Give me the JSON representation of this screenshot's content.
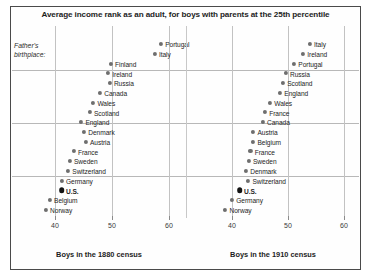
{
  "figure": {
    "title": "Average income rank as an adult, for boys with parents at the 25th percentile",
    "annotation": "Father's\nbirthplace:"
  },
  "panels": [
    {
      "id": "left",
      "caption": "Boys in the 1880 census",
      "axis_ticks": [
        "40",
        "50",
        "60"
      ]
    },
    {
      "id": "right",
      "caption": "Boys in the 1910 census",
      "axis_ticks": [
        "40",
        "50",
        "60"
      ]
    }
  ],
  "chart_data": {
    "type": "scatter",
    "title": "Average income rank as an adult, for boys with parents at the 25th percentile",
    "xlabel": "",
    "ylabel": "",
    "xlim": [
      36,
      62
    ],
    "grid": true,
    "legend": "none",
    "annotations": [
      "Father's birthplace:"
    ],
    "panels": [
      {
        "name": "Boys in the 1880 census",
        "caption": "Boys in the 1880 census",
        "xticks": [
          40,
          50,
          60
        ],
        "points": [
          {
            "label": "Portugal",
            "value": 58.6,
            "highlight": false
          },
          {
            "label": "Italy",
            "value": 57.5,
            "highlight": false
          },
          {
            "label": "Finland",
            "value": 49.8,
            "highlight": false
          },
          {
            "label": "Ireland",
            "value": 49.3,
            "highlight": false
          },
          {
            "label": "Russia",
            "value": 49.6,
            "highlight": false
          },
          {
            "label": "Canada",
            "value": 47.9,
            "highlight": false
          },
          {
            "label": "Wales",
            "value": 46.7,
            "highlight": false
          },
          {
            "label": "Scotland",
            "value": 46.1,
            "highlight": false
          },
          {
            "label": "England",
            "value": 44.6,
            "highlight": false
          },
          {
            "label": "Denmark",
            "value": 45.1,
            "highlight": false
          },
          {
            "label": "Austria",
            "value": 45.4,
            "highlight": false
          },
          {
            "label": "France",
            "value": 43.3,
            "highlight": false
          },
          {
            "label": "Sweden",
            "value": 42.6,
            "highlight": false
          },
          {
            "label": "Switzerland",
            "value": 42.3,
            "highlight": false
          },
          {
            "label": "Germany",
            "value": 41.2,
            "highlight": false
          },
          {
            "label": "U.S.",
            "value": 41.2,
            "highlight": true
          },
          {
            "label": "Belgium",
            "value": 39.1,
            "highlight": false
          },
          {
            "label": "Norway",
            "value": 38.4,
            "highlight": false
          }
        ]
      },
      {
        "name": "Boys in the 1910 census",
        "caption": "Boys in the 1910 census",
        "xticks": [
          40,
          50,
          60
        ],
        "points": [
          {
            "label": "Italy",
            "value": 53.9,
            "highlight": false
          },
          {
            "label": "Ireland",
            "value": 52.7,
            "highlight": false
          },
          {
            "label": "Portugal",
            "value": 51.1,
            "highlight": false
          },
          {
            "label": "Russia",
            "value": 49.6,
            "highlight": false
          },
          {
            "label": "Scotland",
            "value": 49.1,
            "highlight": false
          },
          {
            "label": "England",
            "value": 48.6,
            "highlight": false
          },
          {
            "label": "Wales",
            "value": 46.8,
            "highlight": false
          },
          {
            "label": "France",
            "value": 45.9,
            "highlight": false
          },
          {
            "label": "Canada",
            "value": 45.5,
            "highlight": false
          },
          {
            "label": "Austria",
            "value": 43.8,
            "highlight": false
          },
          {
            "label": "Belgium",
            "value": 43.8,
            "highlight": false
          },
          {
            "label": "France",
            "value": 43.3,
            "highlight": false
          },
          {
            "label": "Sweden",
            "value": 43.0,
            "highlight": false
          },
          {
            "label": "Denmark",
            "value": 42.5,
            "highlight": false
          },
          {
            "label": "Switzerland",
            "value": 42.9,
            "highlight": false
          },
          {
            "label": "U.S.",
            "value": 41.4,
            "highlight": true
          },
          {
            "label": "Germany",
            "value": 40.0,
            "highlight": false
          },
          {
            "label": "Norway",
            "value": 38.8,
            "highlight": false
          }
        ]
      }
    ]
  }
}
